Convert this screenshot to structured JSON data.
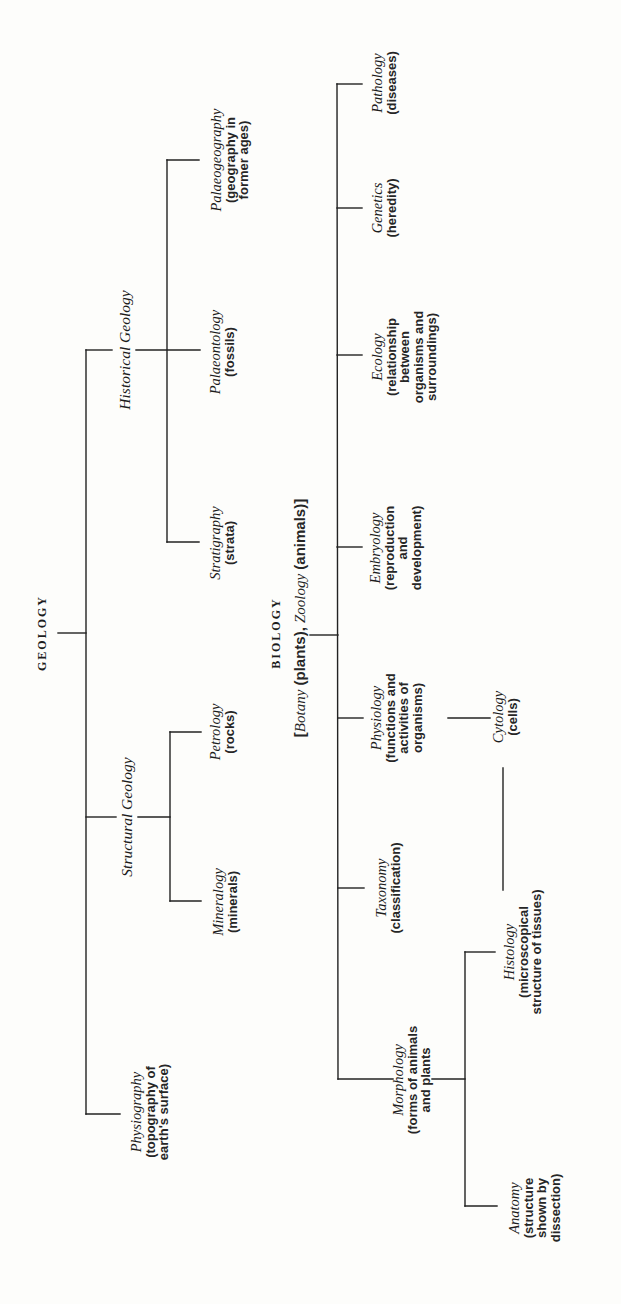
{
  "diagram": {
    "orientation": "rotated-90-ccw",
    "line_color": "#222222",
    "background": "#fdfdfb",
    "geology": {
      "root_label": "GEOLOGY",
      "branches": {
        "physiography": {
          "title": "Physiography",
          "desc": [
            "(topography of",
            "earth's surface)"
          ]
        },
        "structural": {
          "label": "Structural Geology",
          "children": {
            "mineralogy": {
              "title": "Mineralogy",
              "desc": [
                "(minerals)"
              ]
            },
            "petrology": {
              "title": "Petrology",
              "desc": [
                "(rocks)"
              ]
            }
          }
        },
        "historical": {
          "label": "Historical Geology",
          "children": {
            "stratigraphy": {
              "title": "Stratigraphy",
              "desc": [
                "(strata)"
              ]
            },
            "palaeontology": {
              "title": "Palaeontology",
              "desc": [
                "(fossils)"
              ]
            },
            "palaeogeography": {
              "title": "Palaeogeography",
              "desc": [
                "(geography in",
                "former ages)"
              ]
            }
          }
        }
      }
    },
    "biology": {
      "root_label": "BIOLOGY",
      "subtitle": {
        "open": "[",
        "botany": "Botany",
        "botany_desc": " (plants), ",
        "zoology": "Zoology",
        "zoology_desc": " (animals)]"
      },
      "branches": {
        "morphology": {
          "title": "Morphology",
          "desc": [
            "(forms of animals",
            "and plants"
          ],
          "children": {
            "anatomy": {
              "title": "Anatomy",
              "desc": [
                "(structure",
                "shown by",
                "dissection)"
              ]
            },
            "histology": {
              "title": "Histology",
              "desc": [
                "(microscopical",
                "structure of tissues)"
              ]
            }
          }
        },
        "taxonomy": {
          "title": "Taxonomy",
          "desc": [
            "(classification)"
          ]
        },
        "physiology": {
          "title": "Physiology",
          "desc": [
            "(functions and",
            "activities of",
            "organisms)"
          ]
        },
        "cytology": {
          "title": "Cytology",
          "desc": [
            "(cells)"
          ]
        },
        "embryology": {
          "title": "Embryology",
          "desc": [
            "(reproduction",
            "and",
            "development)"
          ]
        },
        "ecology": {
          "title": "Ecology",
          "desc": [
            "(relationship",
            "between",
            "organisms and",
            "surroundings)"
          ]
        },
        "genetics": {
          "title": "Genetics",
          "desc": [
            "(heredity)"
          ]
        },
        "pathology": {
          "title": "Pathology",
          "desc": [
            "(diseases)"
          ]
        }
      }
    }
  }
}
